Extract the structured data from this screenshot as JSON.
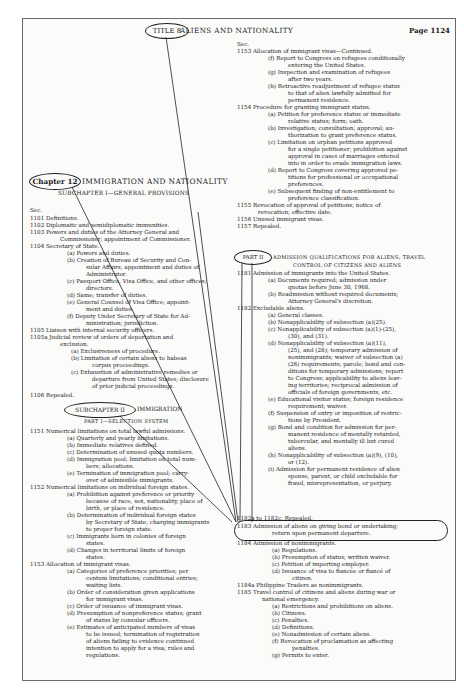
{
  "header": {
    "title_label": "TITLE 8",
    "title_text": "ALIENS AND NATIONALITY",
    "page": "Page 1124"
  },
  "chapter": {
    "label": "Chapter 12",
    "title": "IMMIGRATION AND NATIONALITY",
    "subchapter1": "SUBCHAPTER I—GENERAL PROVISIONS",
    "subchapter2_label": "SUBCHAPTER II",
    "subchapter2_title": "IMMIGRATION",
    "part1": "PART I—SELECTION SYSTEM",
    "part2_label": "PART II",
    "part2_title_line1": "ADMISSION QUALIFICATIONS FOR ALIENS; TRAVEL",
    "part2_title_line2": "CONTROL OF CITIZENS AND ALIENS",
    "sec_label": "Sec."
  },
  "left_column": [
    {
      "y": 207,
      "x": 30,
      "text": "Sec."
    },
    {
      "y": 215,
      "x": 30,
      "text": "1101  Definitions."
    },
    {
      "y": 222,
      "x": 30,
      "text": "1102  Diplomatic and semidiplomatic immunities."
    },
    {
      "y": 229,
      "x": 30,
      "text": "1103  Powers and duties of the Attorney General and"
    },
    {
      "y": 236,
      "x": 60,
      "text": "Commissioner; appointment of Commissioner."
    },
    {
      "y": 243,
      "x": 30,
      "text": "1104  Secretary of State."
    },
    {
      "y": 250,
      "x": 67,
      "text": "(a)  Powers and duties."
    },
    {
      "y": 257,
      "x": 67,
      "text": "(b)  Creation of Bureau of Security and Con-"
    },
    {
      "y": 264,
      "x": 86,
      "text": "sular Affairs; appointment and duties of"
    },
    {
      "y": 271,
      "x": 86,
      "text": "Administrator."
    },
    {
      "y": 278,
      "x": 67,
      "text": "(c)  Passport Office, Visa Office, and other offices;"
    },
    {
      "y": 285,
      "x": 86,
      "text": "directors."
    },
    {
      "y": 292,
      "x": 67,
      "text": "(d)  Same; transfer of duties."
    },
    {
      "y": 299,
      "x": 67,
      "text": "(e)  General Counsel of Visa Office; appoint-"
    },
    {
      "y": 306,
      "x": 86,
      "text": "ment and duties."
    },
    {
      "y": 313,
      "x": 67,
      "text": "(f)  Deputy Under Secretary of State for Ad-"
    },
    {
      "y": 320,
      "x": 86,
      "text": "ministration; jurisdiction."
    },
    {
      "y": 327,
      "x": 30,
      "text": "1105  Liaison with internal security officers."
    },
    {
      "y": 334,
      "x": 30,
      "text": "1105a  Judicial review of orders of deportation and"
    },
    {
      "y": 341,
      "x": 60,
      "text": "exclusion."
    },
    {
      "y": 348,
      "x": 71,
      "text": "(a)  Exclusiveness of procedure."
    },
    {
      "y": 355,
      "x": 71,
      "text": "(b)  Limitation of certain aliens to habeas"
    },
    {
      "y": 362,
      "x": 92,
      "text": "corpus proceedings."
    },
    {
      "y": 369,
      "x": 71,
      "text": "(c)  Exhaustion of administrative remedies or"
    },
    {
      "y": 376,
      "x": 92,
      "text": "departure from United States; disclosure"
    },
    {
      "y": 383,
      "x": 92,
      "text": "of prior judicial proceedings."
    },
    {
      "y": 392,
      "x": 30,
      "text": "1106  Repealed."
    },
    {
      "y": 428,
      "x": 30,
      "text": "1151   Numerical limitations on total lawful admissions."
    },
    {
      "y": 435,
      "x": 67,
      "text": "(a)  Quarterly and yearly limitations."
    },
    {
      "y": 442,
      "x": 67,
      "text": "(b)  Immediate relatives defined."
    },
    {
      "y": 449,
      "x": 67,
      "text": "(c)  Determination of unused quota numbers."
    },
    {
      "y": 456,
      "x": 67,
      "text": "(d)  Immigration pool; limitation on total num-"
    },
    {
      "y": 463,
      "x": 86,
      "text": "bers; allocations."
    },
    {
      "y": 470,
      "x": 67,
      "text": "(e)  Termination of immigration pool; carry-"
    },
    {
      "y": 477,
      "x": 86,
      "text": "over of admissible immigrants."
    },
    {
      "y": 484,
      "x": 30,
      "text": "1152   Numerical limitations on individual foreign states."
    },
    {
      "y": 491,
      "x": 67,
      "text": "(a)  Prohibition against preference or priority"
    },
    {
      "y": 498,
      "x": 86,
      "text": "because of race, sex, nationality, place of"
    },
    {
      "y": 505,
      "x": 86,
      "text": "birth, or place of residence."
    },
    {
      "y": 512,
      "x": 67,
      "text": "(b)  Determination of individual foreign states"
    },
    {
      "y": 519,
      "x": 86,
      "text": "by Secretary of State; charging immigrants"
    },
    {
      "y": 526,
      "x": 86,
      "text": "to proper foreign state."
    },
    {
      "y": 533,
      "x": 67,
      "text": "(c)  Immigrants born in colonies of foreign"
    },
    {
      "y": 540,
      "x": 86,
      "text": "states."
    },
    {
      "y": 547,
      "x": 67,
      "text": "(d)  Changes in territorial limits of foreign"
    },
    {
      "y": 554,
      "x": 86,
      "text": "states."
    },
    {
      "y": 561,
      "x": 30,
      "text": "1153   Allocation of immigrant visas."
    },
    {
      "y": 568,
      "x": 67,
      "text": "(a)  Categories of preference priorities; per"
    },
    {
      "y": 575,
      "x": 86,
      "text": "centum limitations; conditional entries;"
    },
    {
      "y": 582,
      "x": 86,
      "text": "waiting lists."
    },
    {
      "y": 589,
      "x": 67,
      "text": "(b)  Order of consideration given applications"
    },
    {
      "y": 596,
      "x": 86,
      "text": "for immigrant visas."
    },
    {
      "y": 603,
      "x": 67,
      "text": "(c)  Order of issuance of immigrant visas."
    },
    {
      "y": 610,
      "x": 67,
      "text": "(d)  Presumption of nonpreference status; grant"
    },
    {
      "y": 617,
      "x": 86,
      "text": "of status by consular officers."
    },
    {
      "y": 624,
      "x": 67,
      "text": "(e)  Estimates of anticipated numbers of visas"
    },
    {
      "y": 631,
      "x": 86,
      "text": "to be issued; termination of registration"
    },
    {
      "y": 638,
      "x": 86,
      "text": "of aliens failing to evidence continued"
    },
    {
      "y": 645,
      "x": 86,
      "text": "intention to apply for a visa; rules and"
    },
    {
      "y": 652,
      "x": 86,
      "text": "regulations."
    }
  ],
  "right_column": [
    {
      "y": 41,
      "x": 237,
      "text": "Sec."
    },
    {
      "y": 48,
      "x": 237,
      "text": "1153  Allocation of immigrant visas—Continued."
    },
    {
      "y": 55,
      "x": 268,
      "text": "(f)  Report to Congress on refugees conditionally"
    },
    {
      "y": 62,
      "x": 288,
      "text": "entering the United States."
    },
    {
      "y": 69,
      "x": 268,
      "text": "(g)  Inspection and examination of refugees"
    },
    {
      "y": 76,
      "x": 288,
      "text": "after two years."
    },
    {
      "y": 83,
      "x": 268,
      "text": "(h)  Retroactive readjustment of refugee status"
    },
    {
      "y": 90,
      "x": 288,
      "text": "to that of alien lawfully admitted for"
    },
    {
      "y": 97,
      "x": 288,
      "text": "permanent residence."
    },
    {
      "y": 104,
      "x": 237,
      "text": "1154   Procedure for granting immigrant status."
    },
    {
      "y": 111,
      "x": 268,
      "text": "(a)  Petition for preference status or immediate"
    },
    {
      "y": 118,
      "x": 288,
      "text": "relative status; form; oath."
    },
    {
      "y": 125,
      "x": 268,
      "text": "(b)  Investigation; consultation; approval; au-"
    },
    {
      "y": 132,
      "x": 288,
      "text": "thorization to grant preference status."
    },
    {
      "y": 139,
      "x": 268,
      "text": "(c)  Limitation on orphan petitions approved"
    },
    {
      "y": 146,
      "x": 288,
      "text": "for a single petitioner; prohibition against"
    },
    {
      "y": 153,
      "x": 288,
      "text": "approval in cases of marriages entered"
    },
    {
      "y": 160,
      "x": 288,
      "text": "into in order to evade immigration laws."
    },
    {
      "y": 167,
      "x": 268,
      "text": "(d)  Report to Congress covering approved pe-"
    },
    {
      "y": 174,
      "x": 288,
      "text": "titions for professional or occupational"
    },
    {
      "y": 181,
      "x": 288,
      "text": "preferences."
    },
    {
      "y": 188,
      "x": 268,
      "text": "(e)  Subsequent finding of non-entitlement to"
    },
    {
      "y": 195,
      "x": 288,
      "text": "preference classification."
    },
    {
      "y": 202,
      "x": 237,
      "text": "1155   Revocation of approval of petitions; notice of"
    },
    {
      "y": 209,
      "x": 258,
      "text": "revocation; effective date."
    },
    {
      "y": 216,
      "x": 237,
      "text": "1156   Unused immigrant visas."
    },
    {
      "y": 223,
      "x": 237,
      "text": "1157   Repealed."
    },
    {
      "y": 270,
      "x": 237,
      "text": "1181   Admission of immigrants into the United States."
    },
    {
      "y": 277,
      "x": 268,
      "text": "(a)  Documents required; admission under"
    },
    {
      "y": 284,
      "x": 288,
      "text": "quotas before June 30, 1968."
    },
    {
      "y": 291,
      "x": 268,
      "text": "(b)  Readmission without required documents;"
    },
    {
      "y": 298,
      "x": 288,
      "text": "Attorney General's discretion."
    },
    {
      "y": 305,
      "x": 237,
      "text": "1182   Excludable aliens."
    },
    {
      "y": 312,
      "x": 268,
      "text": "(a)  General classes."
    },
    {
      "y": 319,
      "x": 268,
      "text": "(b)  Nonapplicability of subsection (a)(25)."
    },
    {
      "y": 326,
      "x": 268,
      "text": "(c)  Nonapplicability of subsection (a)(1)-(25),"
    },
    {
      "y": 333,
      "x": 288,
      "text": "(30), and (31)."
    },
    {
      "y": 340,
      "x": 268,
      "text": "(d)  Nonapplicability of subsection (a)(11),"
    },
    {
      "y": 347,
      "x": 288,
      "text": "(25), and (28); temporary admission of"
    },
    {
      "y": 354,
      "x": 288,
      "text": "nonimmigrants; waiver of subsection (a)"
    },
    {
      "y": 361,
      "x": 288,
      "text": "(26) requirements; parole; bond and con-"
    },
    {
      "y": 368,
      "x": 288,
      "text": "ditions for temporary admissions; report"
    },
    {
      "y": 375,
      "x": 288,
      "text": "to Congress; applicability to aliens leav-"
    },
    {
      "y": 382,
      "x": 288,
      "text": "ing territories; reciprocal admission of"
    },
    {
      "y": 389,
      "x": 288,
      "text": "officials of foreign governments, etc."
    },
    {
      "y": 396,
      "x": 268,
      "text": "(e)  Educational visitor status; foreign residence"
    },
    {
      "y": 403,
      "x": 288,
      "text": "requirement; waiver."
    },
    {
      "y": 410,
      "x": 268,
      "text": "(f)  Suspension of entry or imposition of restric-"
    },
    {
      "y": 417,
      "x": 288,
      "text": "tions by President."
    },
    {
      "y": 424,
      "x": 268,
      "text": "(g)  Bond and condition for admission for per-"
    },
    {
      "y": 431,
      "x": 288,
      "text": "manent residence of mentally retarded,"
    },
    {
      "y": 438,
      "x": 288,
      "text": "tubercular, and mentally ill but cured"
    },
    {
      "y": 445,
      "x": 288,
      "text": "aliens."
    },
    {
      "y": 452,
      "x": 268,
      "text": "(h)  Nonapplicability of subsection (a)(9), (10),"
    },
    {
      "y": 459,
      "x": 288,
      "text": "or (12)."
    },
    {
      "y": 466,
      "x": 268,
      "text": "(i)  Admission for permanent residence of alien"
    },
    {
      "y": 473,
      "x": 288,
      "text": "spouse, parent, or child excludable for"
    },
    {
      "y": 480,
      "x": 288,
      "text": "fraud, misrepresentation, or perjury."
    },
    {
      "y": 515,
      "x": 237,
      "text": "1182a to 1182c.  Repealed."
    },
    {
      "y": 523,
      "x": 237,
      "text": "1183  Admission of aliens on giving bond or undertaking;"
    },
    {
      "y": 530,
      "x": 272,
      "text": "return upon permanent departure."
    },
    {
      "y": 540,
      "x": 237,
      "text": "1184  Admission of nonimmigrants."
    },
    {
      "y": 547,
      "x": 272,
      "text": "(a)  Regulations."
    },
    {
      "y": 554,
      "x": 272,
      "text": "(b)  Presumption of status; written waiver."
    },
    {
      "y": 561,
      "x": 272,
      "text": "(c)  Petition of importing employer."
    },
    {
      "y": 568,
      "x": 272,
      "text": "(d)  Issuance of visa to fiancée or fiancé of"
    },
    {
      "y": 575,
      "x": 292,
      "text": "citizen."
    },
    {
      "y": 582,
      "x": 237,
      "text": "1184a  Philippine Traders as nonimmigrants."
    },
    {
      "y": 589,
      "x": 237,
      "text": "1185  Travel control of citizens and aliens during war or"
    },
    {
      "y": 596,
      "x": 262,
      "text": "national emergency."
    },
    {
      "y": 603,
      "x": 272,
      "text": "(a)  Restrictions and prohibitions on aliens."
    },
    {
      "y": 610,
      "x": 272,
      "text": "(b)  Citizens."
    },
    {
      "y": 617,
      "x": 272,
      "text": "(c)  Penalties."
    },
    {
      "y": 624,
      "x": 272,
      "text": "(d)  Definitions."
    },
    {
      "y": 631,
      "x": 272,
      "text": "(e)  Nonadmission of certain aliens."
    },
    {
      "y": 638,
      "x": 272,
      "text": "(f)  Revocation of proclamation as affecting"
    },
    {
      "y": 645,
      "x": 292,
      "text": "penalties."
    },
    {
      "y": 652,
      "x": 272,
      "text": "(g)  Permits to enter."
    }
  ]
}
